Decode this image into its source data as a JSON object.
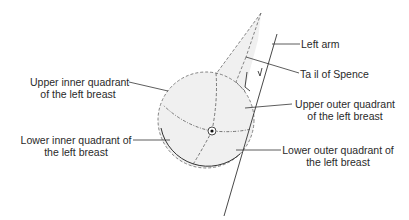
{
  "diagram": {
    "labels": {
      "left_arm": "Left arm",
      "tail_of_spence": "Ta il of Spence",
      "upper_inner_line1": "Upper inner quadrant",
      "upper_inner_line2": "of the left breast",
      "upper_outer_line1": "Upper outer quadrant",
      "upper_outer_line2": "of the left breast",
      "lower_inner_line1": "Lower inner quadrant of",
      "lower_inner_line2": "the left breast",
      "lower_outer_line1": "Lower outer quadrant of",
      "lower_outer_line2": "the left breast"
    },
    "colors": {
      "fill": "#f0f0f0",
      "stroke": "#3a3a3a",
      "text": "#2a2a2a"
    }
  }
}
